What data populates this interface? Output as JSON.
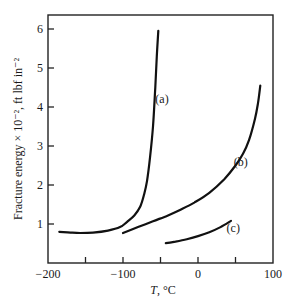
{
  "chart_data": {
    "type": "line",
    "title": "",
    "xlabel": "T, °C",
    "ylabel": "Fracture energy × 10⁻², ft lbf in⁻²",
    "xlim": [
      -200,
      100
    ],
    "ylim": [
      0,
      6.4
    ],
    "xticks": [
      -200,
      -150,
      -100,
      -50,
      0,
      50,
      100
    ],
    "xtick_labels": [
      "−200",
      "",
      "−100",
      "",
      "0",
      "",
      "100"
    ],
    "yticks": [
      1,
      2,
      3,
      4,
      5,
      6
    ],
    "ytick_labels": [
      "1",
      "2",
      "3",
      "4",
      "5",
      "6"
    ],
    "grid": false,
    "legend": "none (curves labeled inline)",
    "series": [
      {
        "name": "(a)",
        "x": [
          -185,
          -170,
          -157,
          -140,
          -120,
          -104,
          -95,
          -85,
          -77,
          -72,
          -68,
          -64,
          -60,
          -57,
          -55,
          -53
        ],
        "y": [
          0.8,
          0.78,
          0.77,
          0.78,
          0.83,
          0.92,
          1.05,
          1.22,
          1.45,
          1.75,
          2.1,
          2.7,
          3.5,
          4.5,
          5.3,
          5.95
        ]
      },
      {
        "name": "(b)",
        "x": [
          -100,
          -80,
          -60,
          -40,
          -24,
          -5,
          15,
          35,
          50,
          60,
          68,
          76,
          80,
          83
        ],
        "y": [
          0.77,
          0.92,
          1.07,
          1.22,
          1.36,
          1.55,
          1.8,
          2.15,
          2.5,
          2.8,
          3.15,
          3.7,
          4.1,
          4.55
        ]
      },
      {
        "name": "(c)",
        "x": [
          -43,
          -30,
          -15,
          0,
          15,
          30,
          44
        ],
        "y": [
          0.51,
          0.55,
          0.61,
          0.69,
          0.79,
          0.92,
          1.08
        ]
      }
    ],
    "annotations": [
      {
        "text": "(a)",
        "x": -48,
        "y": 4.1
      },
      {
        "text": "(b)",
        "x": 57,
        "y": 2.5
      },
      {
        "text": "(c)",
        "x": 47,
        "y": 0.8
      }
    ]
  },
  "axes": {
    "x_label_italic": "T",
    "x_label_rest": ", °C"
  }
}
